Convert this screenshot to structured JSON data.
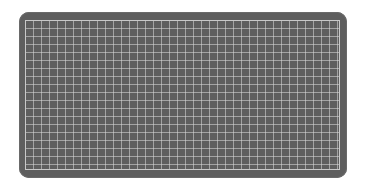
{
  "scene": {
    "subject": "cutting mat with grid",
    "colors": {
      "mat": "#5e5e5e",
      "grid_lines": "#c8c8c8",
      "background": "#ffffff"
    },
    "grid": {
      "cell_px": 8
    }
  }
}
